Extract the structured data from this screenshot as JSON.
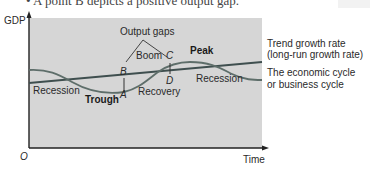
{
  "caption_fragment": "• A point B depicts a positive output gap.",
  "diagram": {
    "y_axis_label": "GDP",
    "x_axis_label": "Time",
    "origin_label": "O",
    "plot_background": "#d6d6d6",
    "curve_color": "#5e6e6a",
    "trend_color": "#3f4f4f",
    "points": {
      "A": "A",
      "B": "B",
      "C": "C",
      "D": "D"
    },
    "phase_labels": {
      "recession_left": "Recession",
      "trough": "Trough",
      "recovery": "Recovery",
      "boom": "Boom",
      "peak": "Peak",
      "recession_right": "Recession"
    },
    "output_gaps_label": "Output gaps",
    "legend": {
      "trend_line1": "Trend growth rate",
      "trend_line2": "(long-run growth rate)",
      "cycle_line1": "The economic cycle",
      "cycle_line2": "or business cycle"
    }
  }
}
